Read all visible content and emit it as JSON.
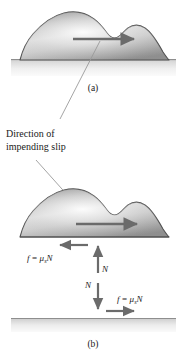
{
  "figure": {
    "title_semantic": "static-friction-impending-slip-diagram",
    "background_color": "#ffffff",
    "ink_color": "#1a1a1a",
    "arrow_color": "#6b6b6b",
    "leader_color": "#9a9a9a",
    "blob_outline_color": "#4d4d4d",
    "blob_fill_light": "#f2f2f2",
    "blob_fill_mid": "#c9c9c9",
    "blob_fill_dark": "#8f8f8f",
    "ground_top_color": "#b5b5b5",
    "ground_bottom_color": "#f4f4f4"
  },
  "annotations": {
    "direction_label_line1": "Direction of",
    "direction_label_line2": "impending slip"
  },
  "panels": [
    {
      "id": "panel-a",
      "caption": "(a)",
      "description": "Block resting on surface with horizontal motion arrow"
    },
    {
      "id": "panel-b",
      "caption": "(b)",
      "description": "Free body diagram with friction and normal forces"
    }
  ],
  "forces": {
    "friction_on_block": {
      "symbol": "f",
      "equals": "=",
      "coefficient": "μ",
      "coefficient_subscript": "s",
      "normal_symbol": "N",
      "direction": "left"
    },
    "friction_on_surface": {
      "symbol": "f",
      "equals": "=",
      "coefficient": "μ",
      "coefficient_subscript": "s",
      "normal_symbol": "N",
      "direction": "right"
    },
    "normal_on_block": {
      "symbol": "N",
      "direction": "up"
    },
    "normal_on_surface": {
      "symbol": "N",
      "direction": "down"
    },
    "applied_motion_a": {
      "symbol": "",
      "direction": "right"
    },
    "applied_motion_b": {
      "symbol": "",
      "direction": "right"
    }
  }
}
